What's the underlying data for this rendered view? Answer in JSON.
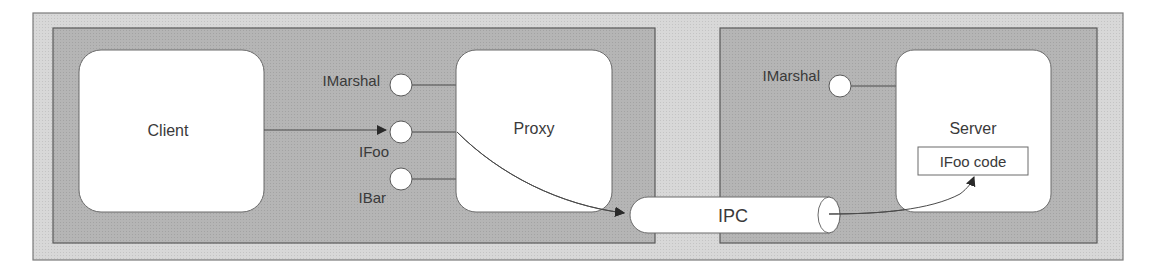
{
  "diagram": {
    "type": "COM proxy/stub marshaling diagram",
    "colors": {
      "outer_fill": "#d6d6d6",
      "inner_fill": "#b3b3b3",
      "box_fill": "#ffffff",
      "stroke": "#555555",
      "text": "#3a3a3a"
    },
    "client_process": {
      "client": {
        "label": "Client"
      },
      "interfaces": [
        {
          "label": "IMarshal"
        },
        {
          "label": "IFoo"
        },
        {
          "label": "IBar"
        }
      ],
      "proxy": {
        "label": "Proxy"
      }
    },
    "channel": {
      "label": "IPC"
    },
    "server_process": {
      "interfaces": [
        {
          "label": "IMarshal"
        }
      ],
      "server": {
        "label": "Server",
        "inner_box": "IFoo code"
      }
    }
  }
}
